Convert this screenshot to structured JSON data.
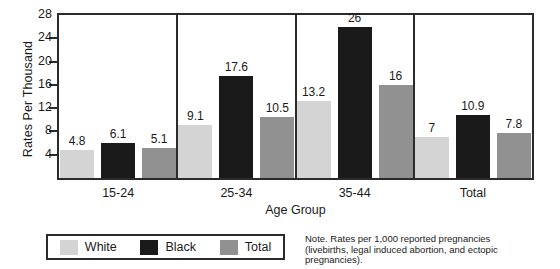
{
  "chart_data": {
    "type": "bar",
    "title": "",
    "xlabel": "Age Group",
    "ylabel": "Rates Per Thousand",
    "ylim": [
      0,
      28
    ],
    "yticks": [
      4,
      8,
      12,
      16,
      20,
      24,
      28
    ],
    "ytick_labels": [
      "4",
      "8",
      "12",
      "16",
      "20",
      "24",
      "28"
    ],
    "grid": false,
    "legend_position": "bottom-left",
    "categories": [
      "15-24",
      "25-34",
      "35-44",
      "Total"
    ],
    "series": [
      {
        "name": "White",
        "color": "#d4d4d4",
        "values": [
          4.8,
          9.1,
          13.2,
          7
        ],
        "labels": [
          "4.8",
          "9.1",
          "13.2",
          "7"
        ]
      },
      {
        "name": "Black",
        "color": "#1a1a1a",
        "values": [
          6.1,
          17.6,
          26,
          10.9
        ],
        "labels": [
          "6.1",
          "17.6",
          "26",
          "10.9"
        ]
      },
      {
        "name": "Total",
        "color": "#919191",
        "values": [
          5.1,
          10.5,
          16,
          7.8
        ],
        "labels": [
          "5.1",
          "10.5",
          "16",
          "7.8"
        ]
      }
    ],
    "note": {
      "lines": [
        "Note.  Rates per 1,000 reported pregnancies",
        "(livebirths, legal induced abortion, and ectopic",
        "pregnancies)."
      ]
    }
  },
  "colors": {
    "axis": "#2b2b2b",
    "background": "#ffffff",
    "text": "#1a1a1a",
    "white_series": "#d4d4d4",
    "black_series": "#1a1a1a",
    "total_series": "#919191"
  }
}
